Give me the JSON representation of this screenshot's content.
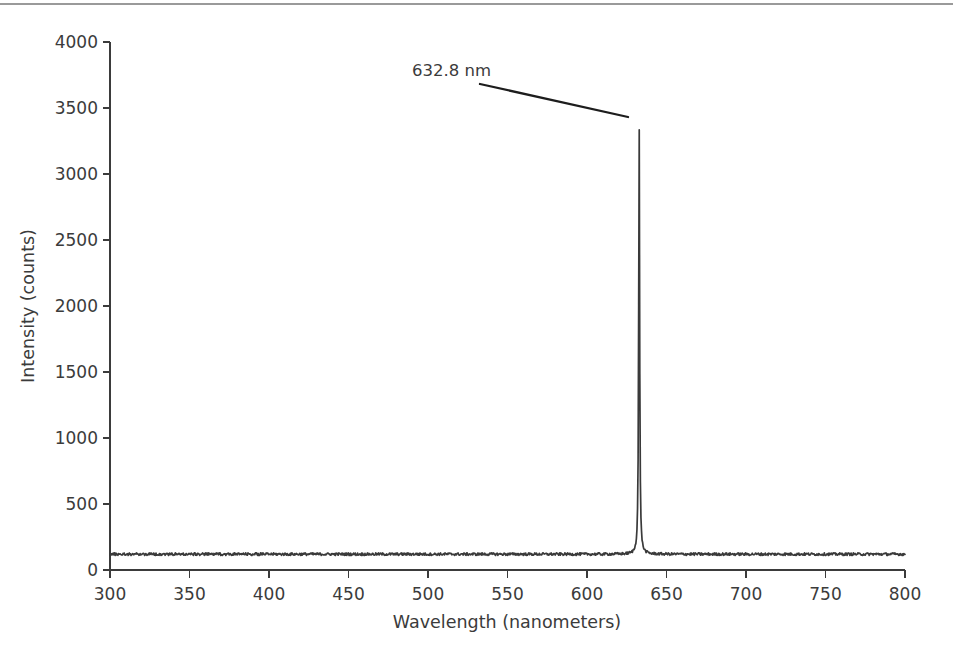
{
  "figure": {
    "background_color": "#ffffff",
    "trace_color": "#3a3a3a",
    "axis_color": "#3b3b3b",
    "annotation_color": "#1d1d1d"
  },
  "chart_data": {
    "type": "line",
    "title": "",
    "subtitle": "",
    "xlabel": "Wavelength (nanometers)",
    "ylabel": "Intensity (counts)",
    "xlim": [
      300,
      800
    ],
    "ylim": [
      0,
      4000
    ],
    "xticks": [
      300,
      350,
      400,
      450,
      500,
      550,
      600,
      650,
      700,
      750,
      800
    ],
    "xtick_labels": [
      "300",
      "350",
      "400",
      "450",
      "500",
      "550",
      "600",
      "650",
      "700",
      "750",
      "800"
    ],
    "yticks": [
      0,
      500,
      1000,
      1500,
      2000,
      2500,
      3000,
      3500,
      4000
    ],
    "ytick_labels": [
      "0",
      "500",
      "1000",
      "1500",
      "2000",
      "2500",
      "3000",
      "3500",
      "4000"
    ],
    "grid": false,
    "legend": null,
    "legend_position": "none",
    "series": [
      {
        "name": "HeNe laser emission spectrum",
        "baseline_counts": 120,
        "noise_amplitude": 10,
        "peak_center_nm": 632.8,
        "peak_height_counts": 3420,
        "peak_fwhm_nm": 2.4,
        "points": [
          {
            "x": 300,
            "y": 118
          },
          {
            "x": 320,
            "y": 121
          },
          {
            "x": 340,
            "y": 117
          },
          {
            "x": 360,
            "y": 122
          },
          {
            "x": 380,
            "y": 119
          },
          {
            "x": 400,
            "y": 120
          },
          {
            "x": 420,
            "y": 123
          },
          {
            "x": 440,
            "y": 118
          },
          {
            "x": 460,
            "y": 121
          },
          {
            "x": 480,
            "y": 120
          },
          {
            "x": 500,
            "y": 119
          },
          {
            "x": 520,
            "y": 122
          },
          {
            "x": 540,
            "y": 120
          },
          {
            "x": 560,
            "y": 118
          },
          {
            "x": 580,
            "y": 123
          },
          {
            "x": 600,
            "y": 121
          },
          {
            "x": 620,
            "y": 120
          },
          {
            "x": 628,
            "y": 124
          },
          {
            "x": 631,
            "y": 420
          },
          {
            "x": 632.2,
            "y": 2100
          },
          {
            "x": 632.8,
            "y": 3420
          },
          {
            "x": 633.4,
            "y": 2050
          },
          {
            "x": 634.5,
            "y": 380
          },
          {
            "x": 636,
            "y": 130
          },
          {
            "x": 640,
            "y": 120
          },
          {
            "x": 660,
            "y": 122
          },
          {
            "x": 680,
            "y": 119
          },
          {
            "x": 700,
            "y": 121
          },
          {
            "x": 720,
            "y": 120
          },
          {
            "x": 740,
            "y": 123
          },
          {
            "x": 760,
            "y": 119
          },
          {
            "x": 780,
            "y": 121
          },
          {
            "x": 800,
            "y": 120
          }
        ]
      }
    ],
    "annotations": [
      {
        "label": "632.8 nm",
        "target_x_nm": 632.8,
        "target_y_counts": 3420,
        "kind": "leader-line"
      }
    ]
  },
  "page": {
    "bottom_artifact_text": ""
  }
}
